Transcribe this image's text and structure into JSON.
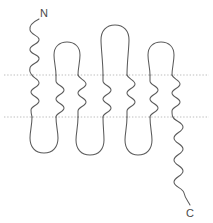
{
  "figure": {
    "type": "membrane-protein-topology-diagram",
    "background_color": "#ffffff",
    "stroke_color": "#5a5a5a",
    "membrane_line_color": "#b9b9b9",
    "width": 213,
    "height": 223
  },
  "labels": {
    "n_terminus": "N",
    "c_terminus": "C"
  },
  "membrane": {
    "outer_boundary_y": 75,
    "inner_boundary_y": 117,
    "style": "dotted"
  },
  "segments": {
    "count": 7,
    "x_positions": [
      32,
      56,
      78,
      103,
      127,
      150,
      172
    ],
    "top_y": 75,
    "bottom_y": 117
  },
  "loops": {
    "extracellular": [
      {
        "from": 56,
        "to": 78,
        "apex_y": 44
      },
      {
        "from": 103,
        "to": 127,
        "apex_y": 28
      },
      {
        "from": 150,
        "to": 172,
        "apex_y": 45
      }
    ],
    "intracellular": [
      {
        "from": 32,
        "to": 56,
        "apex_y": 148
      },
      {
        "from": 78,
        "to": 103,
        "apex_y": 150
      },
      {
        "from": 127,
        "to": 150,
        "apex_y": 150
      }
    ]
  },
  "termini": {
    "n_tail": {
      "start_x": 34,
      "start_y": 21,
      "end_x": 32,
      "end_y": 75,
      "label_x": 42,
      "label_y": 16
    },
    "c_tail": {
      "start_x": 172,
      "start_y": 117,
      "end_x": 190,
      "end_y": 205,
      "label_x": 186,
      "label_y": 216
    }
  }
}
